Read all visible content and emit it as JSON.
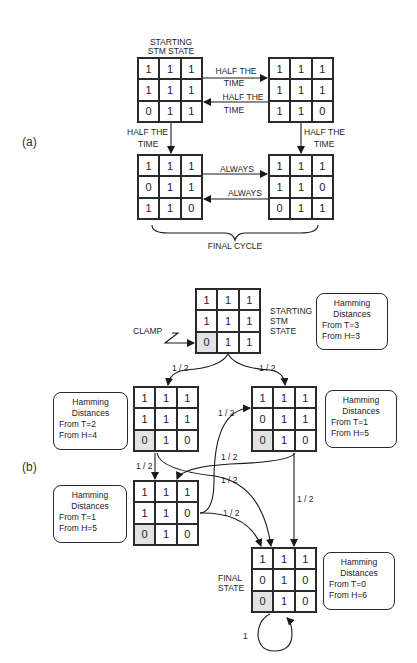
{
  "panel_a": {
    "label": "(a)",
    "starting_label_line1": "STARTING",
    "starting_label_line2": "STM STATE",
    "grids": [
      {
        "id": "a1",
        "cells": [
          "1",
          "1",
          "1",
          "1",
          "1",
          "1",
          "0",
          "1",
          "1"
        ]
      },
      {
        "id": "a2",
        "cells": [
          "1",
          "1",
          "1",
          "1",
          "1",
          "1",
          "1",
          "1",
          "0"
        ]
      },
      {
        "id": "a3",
        "cells": [
          "1",
          "1",
          "1",
          "0",
          "1",
          "1",
          "1",
          "1",
          "0"
        ]
      },
      {
        "id": "a4",
        "cells": [
          "1",
          "1",
          "1",
          "1",
          "1",
          "0",
          "0",
          "1",
          "1"
        ]
      }
    ],
    "edges": {
      "a1_to_a2": {
        "line1": "HALF THE",
        "line2": "TIME"
      },
      "a2_to_a1": {
        "line1": "HALF THE",
        "line2": "TIME"
      },
      "a1_to_a3": {
        "line1": "HALF THE",
        "line2": "TIME"
      },
      "a2_to_a4": {
        "line1": "HALF THE",
        "line2": "TIME"
      },
      "a3_to_a4": "ALWAYS",
      "a4_to_a3": "ALWAYS"
    },
    "final_cycle_label": "FINAL CYCLE"
  },
  "panel_b": {
    "label": "(b)",
    "clamp_label": "CLAMP",
    "start_label": [
      "STARTING",
      "STM",
      "STATE"
    ],
    "final_label": [
      "FINAL",
      "STATE"
    ],
    "grids": [
      {
        "id": "b_start",
        "cells": [
          "1",
          "1",
          "1",
          "1",
          "1",
          "1",
          "0",
          "1",
          "1"
        ]
      },
      {
        "id": "b_left",
        "cells": [
          "1",
          "1",
          "1",
          "1",
          "1",
          "1",
          "0",
          "1",
          "0"
        ]
      },
      {
        "id": "b_right",
        "cells": [
          "1",
          "1",
          "1",
          "0",
          "1",
          "1",
          "0",
          "1",
          "0"
        ]
      },
      {
        "id": "b_lower",
        "cells": [
          "1",
          "1",
          "1",
          "1",
          "1",
          "0",
          "0",
          "1",
          "0"
        ]
      },
      {
        "id": "b_final",
        "cells": [
          "1",
          "1",
          "1",
          "0",
          "1",
          "0",
          "0",
          "1",
          "0"
        ]
      }
    ],
    "hamming_boxes": [
      {
        "title1": "Hamming",
        "title2": "Distances",
        "t": "From  T=3",
        "h": "From  H=3"
      },
      {
        "title1": "Hamming",
        "title2": "Distances",
        "t": "From  T=2",
        "h": "From  H=4"
      },
      {
        "title1": "Hamming",
        "title2": "Distances",
        "t": "From  T=1",
        "h": "From  H=5"
      },
      {
        "title1": "Hamming",
        "title2": "Distances",
        "t": "From  T=1",
        "h": "From  H=5"
      },
      {
        "title1": "Hamming",
        "title2": "Distances",
        "t": "From  T=0",
        "h": "From  H=6"
      }
    ],
    "probabilities": {
      "start_to_left": "1 / 2",
      "start_to_right": "1 / 2",
      "left_to_lower": "1 / 2",
      "left_to_final": "1 / 2",
      "right_to_lower": "1 / 2",
      "right_to_final": "1 / 2",
      "lower_to_right": "1 / 2",
      "lower_to_final": "1 / 2",
      "final_self_loop": "1"
    }
  }
}
